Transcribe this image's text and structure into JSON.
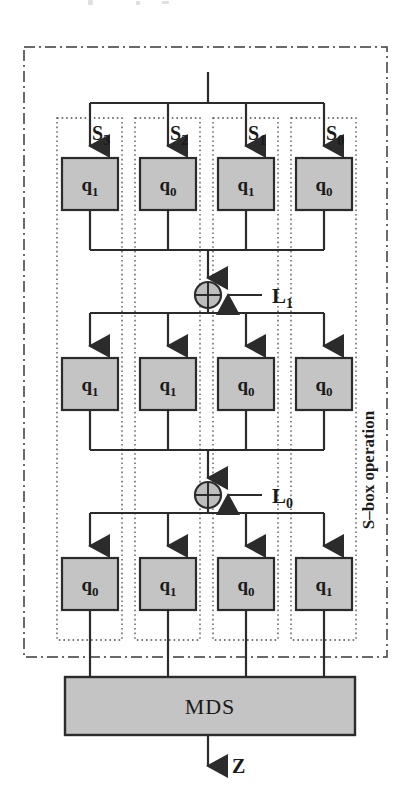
{
  "figure": {
    "group_label": "S–box operation",
    "input_label": "",
    "output_label": "Z",
    "mds_label": "MDS"
  },
  "colors": {
    "box_fill": "#c4c4c4",
    "box_stroke": "#2b2b2b",
    "mds_fill": "#c4c4c4",
    "mds_stroke": "#2b2b2b",
    "xor_fill": "#bdbdbd",
    "xor_stroke": "#2b2b2b",
    "wire": "#2b2b2b",
    "outer_border": "#3a3a3a",
    "column_border": "#4a4a4a",
    "text": "#1a1a1a",
    "background": "#ffffff"
  },
  "columns": [
    {
      "id": "col-s3",
      "label": "S",
      "subscript": "3"
    },
    {
      "id": "col-s2",
      "label": "S",
      "subscript": "2"
    },
    {
      "id": "col-s1",
      "label": "S",
      "subscript": "1"
    },
    {
      "id": "col-s0",
      "label": "S",
      "subscript": "0"
    }
  ],
  "rows": [
    {
      "id": "row-1",
      "boxes": [
        {
          "label": "q",
          "subscript": "1"
        },
        {
          "label": "q",
          "subscript": "0"
        },
        {
          "label": "q",
          "subscript": "1"
        },
        {
          "label": "q",
          "subscript": "0"
        }
      ]
    },
    {
      "id": "row-2",
      "boxes": [
        {
          "label": "q",
          "subscript": "1"
        },
        {
          "label": "q",
          "subscript": "1"
        },
        {
          "label": "q",
          "subscript": "0"
        },
        {
          "label": "q",
          "subscript": "0"
        }
      ]
    },
    {
      "id": "row-3",
      "boxes": [
        {
          "label": "q",
          "subscript": "0"
        },
        {
          "label": "q",
          "subscript": "1"
        },
        {
          "label": "q",
          "subscript": "0"
        },
        {
          "label": "q",
          "subscript": "1"
        }
      ]
    }
  ],
  "xors": [
    {
      "id": "xor-l1",
      "operator": "⊕",
      "key_label": "L",
      "key_subscript": "1"
    },
    {
      "id": "xor-l0",
      "operator": "⊕",
      "key_label": "L",
      "key_subscript": "0"
    }
  ],
  "geometry": {
    "outer": {
      "x": 24,
      "y": 47,
      "w": 363,
      "h": 610
    },
    "columns_x": [
      57,
      135,
      213,
      291
    ],
    "column_w": 65,
    "column_tops": [
      118,
      118,
      118,
      118
    ],
    "box_w": 56,
    "box_h": 52,
    "box_x": [
      62,
      140,
      218,
      296
    ],
    "row_box_y": [
      158,
      358,
      558
    ],
    "lane_x": [
      90,
      168,
      246,
      324
    ],
    "center_x": 208,
    "top_stub_y0": 72,
    "fanout_bus_y": [
      103,
      313,
      513
    ],
    "merge_bus_y": [
      250,
      450
    ],
    "xor_cy": [
      295,
      495
    ],
    "xor_r": 13,
    "mds": {
      "x": 65,
      "y": 677,
      "w": 290,
      "h": 58
    },
    "out_arrow_y0": 735,
    "out_arrow_y1": 770
  }
}
